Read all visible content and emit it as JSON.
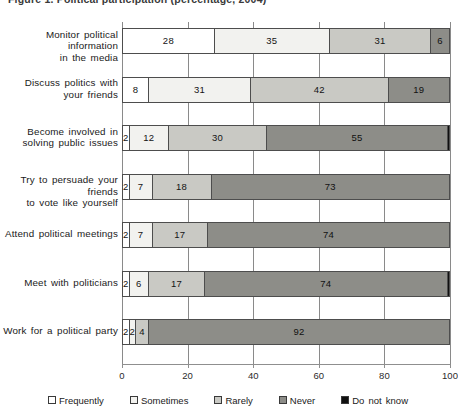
{
  "chart": {
    "title": "Figure 1. Political participation (percentage, 2004)"
  },
  "chart_data": {
    "type": "bar",
    "orientation": "horizontal",
    "stacked": true,
    "stack_total": 100,
    "xlabel": "",
    "ylabel": "",
    "xlim": [
      0,
      100
    ],
    "xticks": [
      0,
      20,
      40,
      60,
      80,
      100
    ],
    "grid": true,
    "legend_position": "bottom",
    "categories": [
      "Monitor political information in the media",
      "Discuss politics with your friends",
      "Become involved in solving public issues",
      "Try to persuade your friends to vote like yourself",
      "Attend political meetings",
      "Meet with politicians",
      "Work for a political party"
    ],
    "category_lines": [
      [
        "Monitor political information",
        "in the media"
      ],
      [
        "Discuss politics with",
        "your friends"
      ],
      [
        "Become involved in",
        "solving public issues"
      ],
      [
        "Try to persuade your friends",
        "to vote like yourself"
      ],
      [
        "Attend political meetings"
      ],
      [
        "Meet with politicians"
      ],
      [
        "Work for a political party"
      ]
    ],
    "series": [
      {
        "name": "Frequently",
        "color": "#ffffff",
        "values": [
          28,
          8,
          2,
          2,
          2,
          2,
          2
        ]
      },
      {
        "name": "Sometimes",
        "color": "#f2f2ef",
        "values": [
          35,
          31,
          12,
          7,
          7,
          6,
          2
        ]
      },
      {
        "name": "Rarely",
        "color": "#c9c9c4",
        "values": [
          31,
          42,
          30,
          18,
          17,
          17,
          4
        ]
      },
      {
        "name": "Never",
        "color": "#8d8d88",
        "values": [
          6,
          19,
          55,
          73,
          74,
          74,
          92
        ]
      },
      {
        "name": "Do not know",
        "color": "#101010",
        "values": [
          0,
          0,
          1,
          0,
          0,
          1,
          0
        ]
      }
    ],
    "rows": [
      {
        "label": "Monitor political information in the media",
        "segments": [
          {
            "series": "Frequently",
            "value": 28,
            "label": "28"
          },
          {
            "series": "Sometimes",
            "value": 35,
            "label": "35"
          },
          {
            "series": "Rarely",
            "value": 31,
            "label": "31"
          },
          {
            "series": "Never",
            "value": 6,
            "label": "6"
          },
          {
            "series": "Do not know",
            "value": 0,
            "label": ""
          }
        ]
      },
      {
        "label": "Discuss politics with your friends",
        "segments": [
          {
            "series": "Frequently",
            "value": 8,
            "label": "8"
          },
          {
            "series": "Sometimes",
            "value": 31,
            "label": "31"
          },
          {
            "series": "Rarely",
            "value": 42,
            "label": "42"
          },
          {
            "series": "Never",
            "value": 19,
            "label": "19"
          },
          {
            "series": "Do not know",
            "value": 0,
            "label": ""
          }
        ]
      },
      {
        "label": "Become involved in solving public issues",
        "segments": [
          {
            "series": "Frequently",
            "value": 2,
            "label": "2"
          },
          {
            "series": "Sometimes",
            "value": 12,
            "label": "12"
          },
          {
            "series": "Rarely",
            "value": 30,
            "label": "30"
          },
          {
            "series": "Never",
            "value": 55,
            "label": "55"
          },
          {
            "series": "Do not know",
            "value": 1,
            "label": ""
          }
        ]
      },
      {
        "label": "Try to persuade your friends to vote like yourself",
        "segments": [
          {
            "series": "Frequently",
            "value": 2,
            "label": "2"
          },
          {
            "series": "Sometimes",
            "value": 7,
            "label": "7"
          },
          {
            "series": "Rarely",
            "value": 18,
            "label": "18"
          },
          {
            "series": "Never",
            "value": 73,
            "label": "73"
          },
          {
            "series": "Do not know",
            "value": 0,
            "label": ""
          }
        ]
      },
      {
        "label": "Attend political meetings",
        "segments": [
          {
            "series": "Frequently",
            "value": 2,
            "label": "2"
          },
          {
            "series": "Sometimes",
            "value": 7,
            "label": "7"
          },
          {
            "series": "Rarely",
            "value": 17,
            "label": "17"
          },
          {
            "series": "Never",
            "value": 74,
            "label": "74"
          },
          {
            "series": "Do not know",
            "value": 0,
            "label": ""
          }
        ]
      },
      {
        "label": "Meet with politicians",
        "segments": [
          {
            "series": "Frequently",
            "value": 2,
            "label": "2"
          },
          {
            "series": "Sometimes",
            "value": 6,
            "label": "6"
          },
          {
            "series": "Rarely",
            "value": 17,
            "label": "17"
          },
          {
            "series": "Never",
            "value": 74,
            "label": "74"
          },
          {
            "series": "Do not know",
            "value": 1,
            "label": ""
          }
        ]
      },
      {
        "label": "Work for a political party",
        "segments": [
          {
            "series": "Frequently",
            "value": 2,
            "label": "2"
          },
          {
            "series": "Sometimes",
            "value": 2,
            "label": "2"
          },
          {
            "series": "Rarely",
            "value": 4,
            "label": "4"
          },
          {
            "series": "Never",
            "value": 92,
            "label": "92"
          },
          {
            "series": "Do not know",
            "value": 0,
            "label": ""
          }
        ]
      }
    ],
    "legend": [
      {
        "label": "Frequently",
        "color": "#ffffff"
      },
      {
        "label": "Sometimes",
        "color": "#f2f2ef"
      },
      {
        "label": "Rarely",
        "color": "#c9c9c4"
      },
      {
        "label": "Never",
        "color": "#8d8d88"
      },
      {
        "label": "Do not know",
        "color": "#101010"
      }
    ]
  }
}
